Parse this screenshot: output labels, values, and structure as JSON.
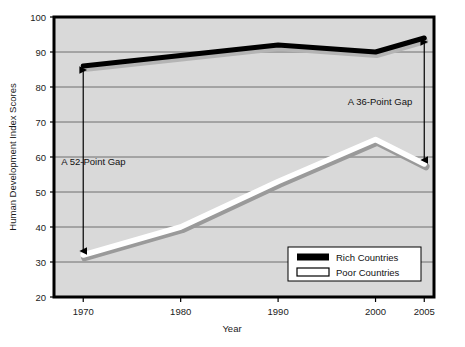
{
  "chart_data": {
    "type": "line",
    "title": "",
    "xlabel": "Year",
    "ylabel": "Human Development Index Scores",
    "x": [
      1970,
      1980,
      1990,
      2000,
      2005
    ],
    "xlim": [
      1967,
      2006
    ],
    "ylim": [
      20,
      100
    ],
    "ytick_labels": [
      "20",
      "30",
      "40",
      "50",
      "60",
      "70",
      "80",
      "90",
      "100"
    ],
    "yticks": [
      20,
      30,
      40,
      50,
      60,
      70,
      80,
      90,
      100
    ],
    "xtick_labels": [
      "1970",
      "1980",
      "1990",
      "2000",
      "2005"
    ],
    "grid": "horizontal",
    "legend_position": "bottom-right",
    "series": [
      {
        "name": "Rich Countries",
        "color": "#000000",
        "values": [
          86,
          89,
          92,
          90,
          94
        ]
      },
      {
        "name": "Poor Countries",
        "color": "#ffffff",
        "values": [
          32,
          40,
          53,
          65,
          58
        ]
      }
    ],
    "annotations": [
      {
        "label": "A  52-Point Gap",
        "x": 1970,
        "from": 86,
        "to": 32
      },
      {
        "label": "A  36-Point Gap",
        "x": 2005,
        "from": 94,
        "to": 58
      }
    ]
  },
  "legend": {
    "entries": [
      {
        "label": "Rich Countries",
        "swatch": "solid-black"
      },
      {
        "label": "Poor Countries",
        "swatch": "outline-white"
      }
    ]
  },
  "colors": {
    "plot_background": "#d9d9d9",
    "frame": "#000000",
    "gridline": "#6f6f6f",
    "rich_line": "#000000",
    "poor_line": "#ffffff",
    "poor_line_edge": "#9a9a9a",
    "text": "#111111"
  }
}
